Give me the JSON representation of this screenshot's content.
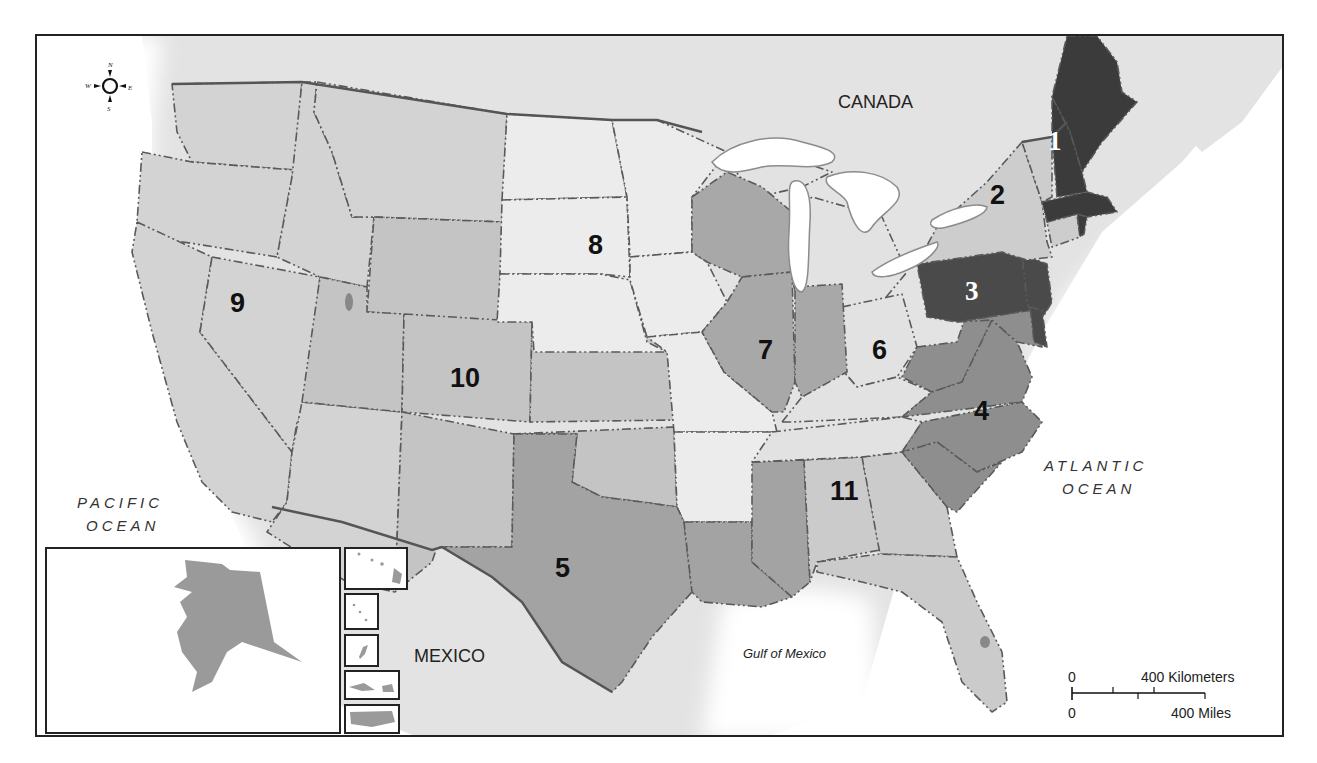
{
  "map": {
    "title": "United States Courts of Appeals Circuits",
    "place_labels": {
      "canada": "CANADA",
      "mexico": "MEXICO",
      "pacific_line1": "PACIFIC",
      "pacific_line2": "OCEAN",
      "atlantic_line1": "ATLANTIC",
      "atlantic_line2": "OCEAN",
      "gulf": "Gulf of Mexico"
    },
    "compass": {
      "n": "N",
      "s": "S",
      "e": "E",
      "w": "W"
    },
    "scale_bar": {
      "km_start": "0",
      "km_label": "400 Kilometers",
      "mi_start": "0",
      "mi_label": "400 Miles"
    },
    "circuits": [
      {
        "number": "1",
        "states": [
          "Maine",
          "New Hampshire",
          "Massachusetts",
          "Rhode Island"
        ],
        "shade": "#3b3b3b"
      },
      {
        "number": "2",
        "states": [
          "New York",
          "Vermont",
          "Connecticut"
        ],
        "shade": "#cdcdcd"
      },
      {
        "number": "3",
        "states": [
          "Pennsylvania",
          "New Jersey",
          "Delaware"
        ],
        "shade": "#4a4a4a"
      },
      {
        "number": "4",
        "states": [
          "West Virginia",
          "Virginia",
          "Maryland",
          "North Carolina",
          "South Carolina"
        ],
        "shade": "#8e8e8e"
      },
      {
        "number": "5",
        "states": [
          "Texas",
          "Louisiana",
          "Mississippi"
        ],
        "shade": "#a3a3a3"
      },
      {
        "number": "6",
        "states": [
          "Michigan",
          "Ohio",
          "Kentucky",
          "Tennessee"
        ],
        "shade": "#e2e2e2"
      },
      {
        "number": "7",
        "states": [
          "Wisconsin",
          "Illinois",
          "Indiana"
        ],
        "shade": "#a8a8a8"
      },
      {
        "number": "8",
        "states": [
          "North Dakota",
          "South Dakota",
          "Nebraska",
          "Minnesota",
          "Iowa",
          "Missouri",
          "Arkansas"
        ],
        "shade": "#ececec"
      },
      {
        "number": "9",
        "states": [
          "Washington",
          "Oregon",
          "California",
          "Nevada",
          "Idaho",
          "Montana",
          "Arizona",
          "Alaska",
          "Hawaii"
        ],
        "shade": "#d3d3d3"
      },
      {
        "number": "10",
        "states": [
          "Wyoming",
          "Utah",
          "Colorado",
          "Kansas",
          "Oklahoma",
          "New Mexico"
        ],
        "shade": "#c4c4c4"
      },
      {
        "number": "11",
        "states": [
          "Alabama",
          "Georgia",
          "Florida"
        ],
        "shade": "#cbcbcb"
      }
    ],
    "insets": [
      "Alaska",
      "Hawaii",
      "Northern Mariana Islands",
      "Guam",
      "Virgin Islands",
      "Puerto Rico"
    ],
    "colors": {
      "land_foreign": "#e3e3e3",
      "water": "#ffffff",
      "frame": "#222222"
    }
  }
}
